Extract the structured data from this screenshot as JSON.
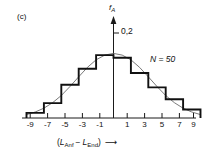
{
  "figure": {
    "panel_label": "(c)",
    "y_axis_title": "f",
    "y_axis_title_sub": "A",
    "y_tick_label": "0,2",
    "series_note": "N = 50",
    "x_axis_title_open": "(",
    "x_axis_title_term1": "L",
    "x_axis_title_sub1": "Anf",
    "x_axis_title_minus": "−",
    "x_axis_title_term2": "L",
    "x_axis_title_sub2": "End",
    "x_axis_title_close": ")",
    "x_axis_title_arrow": "⟶"
  },
  "axis": {
    "x_tick_labels": [
      "-9",
      "-7",
      "-5",
      "-3",
      "-1",
      "1",
      "3",
      "5",
      "7",
      "9"
    ],
    "y_tick_values": [
      "0,2"
    ]
  },
  "colors": {
    "axis": "#1a1a1a",
    "histogram": "#111111",
    "curve": "#555555",
    "background": "#ffffff"
  },
  "chart_data": {
    "type": "bar",
    "title": "",
    "subtitle": "",
    "xlabel": "(L_Anf - L_End)",
    "ylabel": "f_A",
    "categories": [
      "-9",
      "-7",
      "-5",
      "-3",
      "-1",
      "1",
      "3",
      "5",
      "7",
      "9"
    ],
    "bin_edges": [
      -10,
      -8,
      -6,
      -4,
      -2,
      0,
      2,
      4,
      6,
      8,
      10
    ],
    "bin_centers": [
      -9,
      -7,
      -5,
      -3,
      -1,
      1,
      3,
      5,
      7,
      9
    ],
    "values": [
      0.012,
      0.035,
      0.078,
      0.116,
      0.148,
      0.142,
      0.106,
      0.072,
      0.044,
      0.02
    ],
    "xlim": [
      -10,
      10
    ],
    "ylim": [
      0,
      0.235
    ],
    "ytick_positions": [
      0.2
    ],
    "grid": false,
    "legend": "none",
    "annotations": [
      {
        "text": "(c)",
        "position": "top-left"
      },
      {
        "text": "N = 50",
        "position": "upper-right"
      }
    ],
    "series": [
      {
        "name": "relative frequency histogram",
        "type": "step",
        "values": [
          0.012,
          0.035,
          0.078,
          0.116,
          0.148,
          0.142,
          0.106,
          0.072,
          0.044,
          0.02
        ]
      },
      {
        "name": "fitted normal distribution",
        "type": "line",
        "x": [
          -10,
          -9,
          -8,
          -7,
          -6,
          -5,
          -4,
          -3,
          -2,
          -1,
          0,
          1,
          2,
          3,
          4,
          5,
          6,
          7,
          8,
          9,
          10
        ],
        "y": [
          0.008,
          0.014,
          0.023,
          0.036,
          0.053,
          0.074,
          0.097,
          0.119,
          0.137,
          0.148,
          0.152,
          0.148,
          0.137,
          0.119,
          0.097,
          0.074,
          0.053,
          0.036,
          0.023,
          0.014,
          0.008
        ]
      }
    ]
  }
}
